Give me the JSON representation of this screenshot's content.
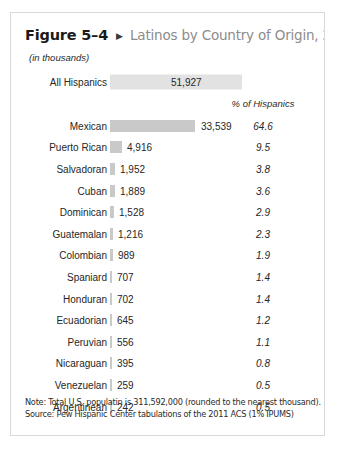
{
  "figure": {
    "number": "Figure 5–4",
    "arrow_icon": "play-triangle-icon",
    "title": "Latinos by Country of Origin, 2011",
    "units_note": "(in thousands)",
    "percent_header": "% of Hispanics",
    "note": "Note: Total U.S. populatin is 311,592,000 (rounded to the nearest thousand).",
    "source": "Source: Pew Hispanic Center tabulations of the 2011 ACS (1% IPUMS)"
  },
  "colors": {
    "bar": "#c9c9c9",
    "total_bar": "#e2e2e2",
    "border": "#d9d9d9",
    "title_gray": "#8c8c8c",
    "text": "#262626"
  },
  "total": {
    "label": "All Hispanics",
    "value": "51,927"
  },
  "chart_data": {
    "type": "bar",
    "title": "Latinos by Country of Origin, 2011",
    "subtitle": "(in thousands)",
    "xlabel": "",
    "ylabel": "",
    "orientation": "horizontal",
    "value_unit": "thousands",
    "grid": false,
    "legend": false,
    "xlim": [
      0,
      51927
    ],
    "total": {
      "label": "All Hispanics",
      "value": 51927,
      "percent": null
    },
    "categories": [
      "Mexican",
      "Puerto Rican",
      "Salvadoran",
      "Cuban",
      "Dominican",
      "Guatemalan",
      "Colombian",
      "Spaniard",
      "Honduran",
      "Ecuadorian",
      "Peruvian",
      "Nicaraguan",
      "Venezuelan",
      "Argentinean"
    ],
    "values": [
      33539,
      4916,
      1952,
      1889,
      1528,
      1216,
      989,
      707,
      702,
      645,
      556,
      395,
      259,
      242
    ],
    "value_labels": [
      "33,539",
      "4,916",
      "1,952",
      "1,889",
      "1,528",
      "1,216",
      "989",
      "707",
      "702",
      "645",
      "556",
      "395",
      "259",
      "242"
    ],
    "percents": [
      64.6,
      9.5,
      3.8,
      3.6,
      2.9,
      2.3,
      1.9,
      1.4,
      1.4,
      1.2,
      1.1,
      0.8,
      0.5,
      0.5
    ],
    "percent_labels": [
      "64.6",
      "9.5",
      "3.8",
      "3.6",
      "2.9",
      "2.3",
      "1.9",
      "1.4",
      "1.4",
      "1.2",
      "1.1",
      "0.8",
      "0.5",
      "0.5"
    ],
    "annotations": [
      "Note: Total U.S. populatin is 311,592,000 (rounded to the nearest thousand).",
      "Source: Pew Hispanic Center tabulations of the 2011 ACS (1% IPUMS)"
    ]
  }
}
